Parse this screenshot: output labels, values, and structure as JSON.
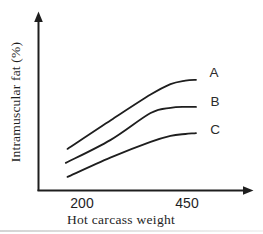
{
  "figure": {
    "background": "#ffffff",
    "ink": "#1e1e1e",
    "label_ink": "#2b2b2b",
    "artifact_line": "#d4d4d4"
  },
  "chart_data": {
    "type": "line",
    "title": "",
    "xlabel": "Hot carcass weight",
    "ylabel": "Intramuscular fat (%)",
    "x_ticks": [
      200,
      450
    ],
    "x_tick_labels": [
      "200",
      "450"
    ],
    "y_ticks": [],
    "x_range": [
      163,
      470
    ],
    "y_range_relative": [
      0,
      100
    ],
    "grid": false,
    "legend_position": "labels at right ends of curves",
    "style": "qualitative textbook curves rising then plateauing; y-axis has no tick values, y given in relative units",
    "series": [
      {
        "name": "A",
        "x": [
          167,
          270,
          363,
          410,
          445,
          470
        ],
        "y": [
          23.5,
          40,
          54.5,
          60.5,
          62.5,
          63
        ]
      },
      {
        "name": "B",
        "x": [
          163,
          268,
          363,
          410,
          445,
          470
        ],
        "y": [
          15.5,
          28.5,
          44,
          47,
          47.5,
          47.5
        ]
      },
      {
        "name": "C",
        "x": [
          167,
          268,
          363,
          410,
          445,
          470
        ],
        "y": [
          7.5,
          18.5,
          27.5,
          31,
          32,
          32.5
        ]
      }
    ]
  }
}
